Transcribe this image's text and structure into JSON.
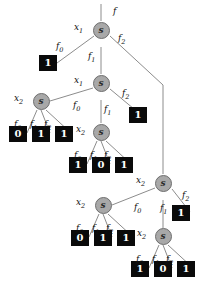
{
  "diagram": {
    "node_symbol": "s",
    "colors": {
      "node_fill": "#a8a8a8",
      "node_stroke": "#6e6e6e",
      "terminal_fill": "#0a0a0a",
      "terminal_text": "#ffffff",
      "edge": "#8c8c8c",
      "background": "#ffffff"
    },
    "root_label": "f",
    "variables": {
      "x1": "x",
      "x1_sub": "1",
      "x2": "x",
      "x2_sub": "2"
    },
    "edge_labels": {
      "f0": "f",
      "f0_sub": "0",
      "f1": "f",
      "f1_sub": "1",
      "f2": "f",
      "f2_sub": "2"
    },
    "nodes": [
      {
        "id": "n1",
        "var_label": "x",
        "var_sub": "1",
        "symbol": "s",
        "x": 101,
        "y": 30
      },
      {
        "id": "n2",
        "var_label": "x",
        "var_sub": "1",
        "symbol": "s",
        "x": 101,
        "y": 83
      },
      {
        "id": "n3",
        "var_label": "x",
        "var_sub": "2",
        "symbol": "s",
        "x": 41,
        "y": 101
      },
      {
        "id": "n4",
        "var_label": "x",
        "var_sub": "2",
        "symbol": "s",
        "x": 101,
        "y": 132
      },
      {
        "id": "n5",
        "var_label": "x",
        "var_sub": "2",
        "symbol": "s",
        "x": 163,
        "y": 183
      },
      {
        "id": "n6",
        "var_label": "x",
        "var_sub": "2",
        "symbol": "s",
        "x": 103,
        "y": 205
      },
      {
        "id": "n7",
        "var_label": "x",
        "var_sub": "2",
        "symbol": "s",
        "x": 163,
        "y": 236
      }
    ],
    "terminals": [
      {
        "id": "t1",
        "value": "1",
        "x": 48,
        "y": 63
      },
      {
        "id": "t2",
        "value": "1",
        "x": 138,
        "y": 115
      },
      {
        "id": "t3",
        "value": "0",
        "x": 18,
        "y": 134
      },
      {
        "id": "t4",
        "value": "1",
        "x": 41,
        "y": 134
      },
      {
        "id": "t5",
        "value": "1",
        "x": 64,
        "y": 134
      },
      {
        "id": "t6",
        "value": "1",
        "x": 78,
        "y": 165
      },
      {
        "id": "t7",
        "value": "0",
        "x": 101,
        "y": 165
      },
      {
        "id": "t8",
        "value": "1",
        "x": 124,
        "y": 165
      },
      {
        "id": "t9",
        "value": "1",
        "x": 181,
        "y": 213
      },
      {
        "id": "t10",
        "value": "0",
        "x": 80,
        "y": 238
      },
      {
        "id": "t11",
        "value": "1",
        "x": 103,
        "y": 238
      },
      {
        "id": "t12",
        "value": "1",
        "x": 126,
        "y": 238
      },
      {
        "id": "t13",
        "value": "1",
        "x": 140,
        "y": 269
      },
      {
        "id": "t14",
        "value": "0",
        "x": 163,
        "y": 269
      },
      {
        "id": "t15",
        "value": "1",
        "x": 186,
        "y": 269
      }
    ],
    "labels": [
      {
        "id": "l-f",
        "text": "f",
        "sub": "",
        "x": 113,
        "y": 6
      },
      {
        "id": "l-x1-a",
        "text": "x",
        "sub": "1",
        "x": 74,
        "y": 22
      },
      {
        "id": "l-f0-a",
        "text": "f",
        "sub": "0",
        "x": 56,
        "y": 41
      },
      {
        "id": "l-f1-a",
        "text": "f",
        "sub": "1",
        "x": 88,
        "y": 51
      },
      {
        "id": "l-f2-a",
        "text": "f",
        "sub": "2",
        "x": 118,
        "y": 33
      },
      {
        "id": "l-x1-b",
        "text": "x",
        "sub": "1",
        "x": 74,
        "y": 75
      },
      {
        "id": "l-f0-b",
        "text": "f",
        "sub": "0",
        "x": 73,
        "y": 100
      },
      {
        "id": "l-f1-b",
        "text": "f",
        "sub": "1",
        "x": 104,
        "y": 104
      },
      {
        "id": "l-f2-b",
        "text": "f",
        "sub": "2",
        "x": 122,
        "y": 88
      },
      {
        "id": "l-x2-a",
        "text": "x",
        "sub": "2",
        "x": 14,
        "y": 93
      },
      {
        "id": "l-f0-c",
        "text": "f",
        "sub": "0",
        "x": 14,
        "y": 119
      },
      {
        "id": "l-f1-c",
        "text": "f",
        "sub": "1",
        "x": 30,
        "y": 119
      },
      {
        "id": "l-f2-c",
        "text": "f",
        "sub": "2",
        "x": 44,
        "y": 119
      },
      {
        "id": "l-x2-b",
        "text": "x",
        "sub": "2",
        "x": 76,
        "y": 124
      },
      {
        "id": "l-f0-d",
        "text": "f",
        "sub": "0",
        "x": 74,
        "y": 150
      },
      {
        "id": "l-f1-d",
        "text": "f",
        "sub": "1",
        "x": 90,
        "y": 150
      },
      {
        "id": "l-f2-d",
        "text": "f",
        "sub": "2",
        "x": 104,
        "y": 150
      },
      {
        "id": "l-x2-c",
        "text": "x",
        "sub": "2",
        "x": 136,
        "y": 175
      },
      {
        "id": "l-f0-e",
        "text": "f",
        "sub": "0",
        "x": 134,
        "y": 202
      },
      {
        "id": "l-f1-e",
        "text": "f",
        "sub": "1",
        "x": 160,
        "y": 203
      },
      {
        "id": "l-f2-e",
        "text": "f",
        "sub": "2",
        "x": 182,
        "y": 190
      },
      {
        "id": "l-x2-d",
        "text": "x",
        "sub": "2",
        "x": 76,
        "y": 197
      },
      {
        "id": "l-f0-f",
        "text": "f",
        "sub": "0",
        "x": 76,
        "y": 223
      },
      {
        "id": "l-f1-f",
        "text": "f",
        "sub": "1",
        "x": 92,
        "y": 223
      },
      {
        "id": "l-f2-f",
        "text": "f",
        "sub": "2",
        "x": 106,
        "y": 223
      },
      {
        "id": "l-x2-e",
        "text": "x",
        "sub": "2",
        "x": 137,
        "y": 228
      },
      {
        "id": "l-f0-g",
        "text": "f",
        "sub": "0",
        "x": 136,
        "y": 254
      },
      {
        "id": "l-f1-g",
        "text": "f",
        "sub": "1",
        "x": 152,
        "y": 254
      },
      {
        "id": "l-f2-g",
        "text": "f",
        "sub": "2",
        "x": 166,
        "y": 254
      }
    ],
    "edges": [
      {
        "id": "e-root-in",
        "d": "M101,4 L101,21"
      },
      {
        "id": "e-n1-f0",
        "d": "M94,36 L57,63"
      },
      {
        "id": "e-n1-f1",
        "d": "M101,47 L101,74"
      },
      {
        "id": "e-n1-f2",
        "d": "M110,36 L163,85"
      },
      {
        "id": "e-n1-f2b",
        "d": "M163,85 L163,174"
      },
      {
        "id": "e-n2-f0",
        "d": "M93,88 L50,101"
      },
      {
        "id": "e-n2-f1",
        "d": "M101,100 L101,123"
      },
      {
        "id": "e-n2-f2",
        "d": "M110,89 L140,114"
      },
      {
        "id": "e-n3-f0",
        "d": "M37,110 L27,133"
      },
      {
        "id": "e-n3-f1",
        "d": "M41,110 L50,133"
      },
      {
        "id": "e-n3-f2",
        "d": "M46,110 L71,133"
      },
      {
        "id": "e-n4-f0",
        "d": "M97,141 L87,164"
      },
      {
        "id": "e-n4-f1",
        "d": "M101,141 L110,164"
      },
      {
        "id": "e-n4-f2",
        "d": "M106,141 L131,164"
      },
      {
        "id": "e-n5-f0",
        "d": "M155,188 L112,205"
      },
      {
        "id": "e-n5-f1",
        "d": "M163,200 L163,228"
      },
      {
        "id": "e-n5-f2",
        "d": "M172,189 L190,212"
      },
      {
        "id": "e-n6-f0",
        "d": "M99,214 L89,237"
      },
      {
        "id": "e-n6-f1",
        "d": "M103,214 L112,237"
      },
      {
        "id": "e-n6-f2",
        "d": "M108,214 L133,237"
      },
      {
        "id": "e-n7-f0",
        "d": "M159,245 L149,268"
      },
      {
        "id": "e-n7-f1",
        "d": "M163,245 L172,268"
      },
      {
        "id": "e-n7-f2",
        "d": "M168,245 L193,268"
      }
    ]
  }
}
